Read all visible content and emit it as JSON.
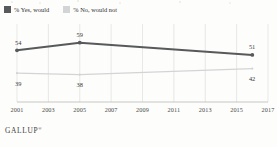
{
  "legend": {
    "items": [
      {
        "label": "% Yes, would",
        "color": "#58595b",
        "name": "legend-swatch-yes"
      },
      {
        "label": "% No, would not",
        "color": "#d3d4d6",
        "name": "legend-swatch-no"
      }
    ]
  },
  "footer": {
    "brand": "GALLUP",
    "mark": "®"
  },
  "chart_data": {
    "type": "line",
    "title": "",
    "subtitle": "",
    "xlabel": "",
    "ylabel": "",
    "xlim": [
      2001,
      2017
    ],
    "ylim": [
      20,
      70
    ],
    "grid": "vertical",
    "legend_position": "top-left",
    "x_tick_labels": [
      "2001",
      "2003",
      "2005",
      "2007",
      "2009",
      "2011",
      "2013",
      "2015",
      "2017"
    ],
    "x_ticks": [
      2001,
      2003,
      2005,
      2007,
      2009,
      2011,
      2013,
      2015,
      2017
    ],
    "series": [
      {
        "name": "% Yes, would",
        "color": "#58595b",
        "x": [
          2001,
          2005,
          2016
        ],
        "values": [
          54,
          59,
          51
        ],
        "point_labels": [
          "54",
          "59",
          "51"
        ],
        "label_position": "above"
      },
      {
        "name": "% No, would not",
        "color": "#d3d4d6",
        "x": [
          2001,
          2005,
          2016
        ],
        "values": [
          39,
          38,
          42
        ],
        "point_labels": [
          "39",
          "38",
          "42"
        ],
        "label_position": "below"
      }
    ]
  }
}
